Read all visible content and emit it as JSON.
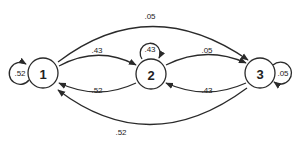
{
  "diagram": {
    "type": "markov-chain-state-transition",
    "colors": {
      "stroke": "#2a2a2a",
      "background": "#ffffff",
      "text": "#222222"
    },
    "nodes": [
      {
        "id": "1",
        "label": "1"
      },
      {
        "id": "2",
        "label": "2"
      },
      {
        "id": "3",
        "label": "3"
      }
    ],
    "edges": [
      {
        "from": "1",
        "to": "1",
        "label": ".52"
      },
      {
        "from": "1",
        "to": "2",
        "label": ".43"
      },
      {
        "from": "1",
        "to": "3",
        "label": ".05"
      },
      {
        "from": "2",
        "to": "1",
        "label": ".52"
      },
      {
        "from": "2",
        "to": "2",
        "label": ".43"
      },
      {
        "from": "2",
        "to": "3",
        "label": ".05"
      },
      {
        "from": "3",
        "to": "1",
        "label": ".52"
      },
      {
        "from": "3",
        "to": "2",
        "label": ".43"
      },
      {
        "from": "3",
        "to": "3",
        "label": ".05"
      }
    ]
  }
}
